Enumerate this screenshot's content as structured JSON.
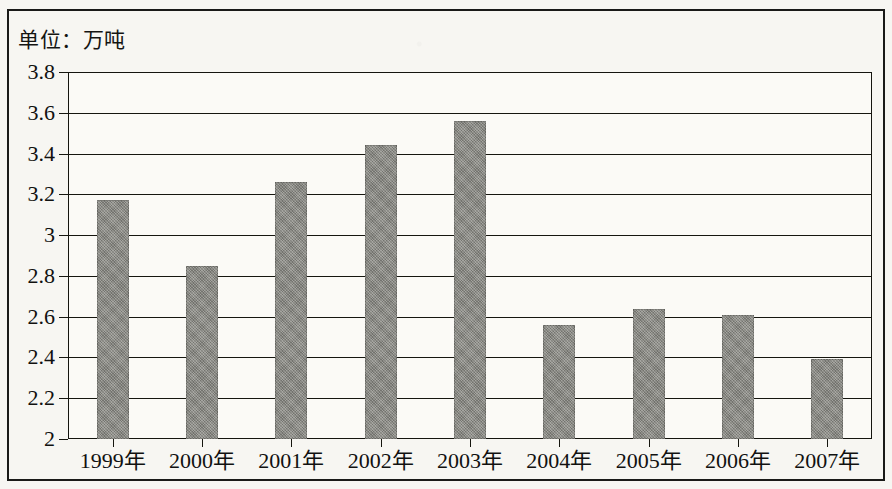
{
  "figure": {
    "unit_label": "单位：万吨",
    "bar_color": "#8b8b85",
    "axis_color": "#16160f",
    "background_color": "#f7f6f2"
  },
  "chart_data": {
    "type": "bar",
    "title": "",
    "subtitle": "",
    "unit_note": "单位：万吨",
    "xlabel": "",
    "ylabel": "",
    "ylim": [
      2,
      3.8
    ],
    "ytick_step": 0.2,
    "grid": true,
    "legend": "none",
    "ytick_labels": [
      "3.8",
      "3.6",
      "3.4",
      "3.2",
      "3",
      "2.8",
      "2.6",
      "2.4",
      "2.2",
      "2"
    ],
    "ytick_values": [
      3.8,
      3.6,
      3.4,
      3.2,
      3.0,
      2.8,
      2.6,
      2.4,
      2.2,
      2.0
    ],
    "categories": [
      "1999年",
      "2000年",
      "2001年",
      "2002年",
      "2003年",
      "2004年",
      "2005年",
      "2006年",
      "2007年"
    ],
    "values": [
      3.17,
      2.85,
      3.26,
      3.44,
      3.56,
      2.56,
      2.64,
      2.61,
      2.39
    ]
  }
}
